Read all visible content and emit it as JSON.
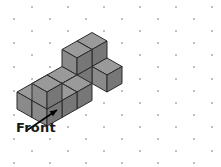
{
  "figure": {
    "title": "",
    "type": "isometric-cube-stack",
    "background_color": "#ffffff",
    "grid": {
      "name": "isometric-dot-grid",
      "dot_color": "#9b9bb0",
      "dot_size": 1.6,
      "x_spacing": 36,
      "y_spacing": 12,
      "row_offset": 18,
      "origin_x": -4,
      "origin_y": 7
    },
    "cube": {
      "half_width": 15,
      "face_rise": 8.5,
      "side_height": 17,
      "top_color": "#9a9a9a",
      "left_color": "#8a8a8a",
      "right_color": "#777777",
      "edge_color": "#2b2b2b",
      "edge_width": 1
    },
    "origin": {
      "x": 47,
      "y": 92
    },
    "cubes": [
      {
        "x": 0,
        "y": 0,
        "z": 0
      },
      {
        "x": 0,
        "y": 0,
        "z": 1
      },
      {
        "x": 1,
        "y": 0,
        "z": 0
      },
      {
        "x": 2,
        "y": 0,
        "z": 0
      },
      {
        "x": 0,
        "y": 1,
        "z": 0
      },
      {
        "x": 1,
        "y": 1,
        "z": 0
      },
      {
        "x": 2,
        "y": 1,
        "z": 0
      },
      {
        "x": 3,
        "y": 1,
        "z": 0
      },
      {
        "x": 4,
        "y": 1,
        "z": 0
      },
      {
        "x": 3,
        "y": 1,
        "z": 1
      },
      {
        "x": 4,
        "y": 1,
        "z": 1
      },
      {
        "x": 4,
        "y": 0,
        "z": 0
      }
    ],
    "annotation": {
      "label": "Front",
      "label_color": "#1a1a1a",
      "arrow_color": "#000000",
      "arrow_from_x": 26,
      "arrow_from_y": 131,
      "arrow_to_x": 57,
      "arrow_to_y": 110
    }
  }
}
